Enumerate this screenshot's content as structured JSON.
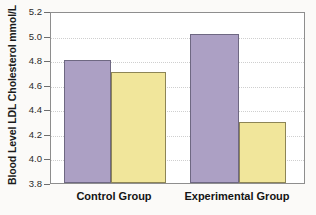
{
  "chart_data": {
    "type": "bar",
    "title": "",
    "xlabel": "",
    "ylabel": "Blood Level LDL Cholesterol mmol/L",
    "ylim": [
      3.8,
      5.2
    ],
    "ytick_labels": [
      "3.8",
      "4.0",
      "4.2",
      "4.4",
      "4.6",
      "4.8",
      "5.0",
      "5.2"
    ],
    "ytick_values": [
      3.8,
      4.0,
      4.2,
      4.4,
      4.6,
      4.8,
      5.0,
      5.2
    ],
    "grid": true,
    "legend": "none",
    "categories": [
      "Control Group",
      "Experimental Group"
    ],
    "series": [
      {
        "name": "series-a",
        "color": "#aca0c4",
        "values": [
          4.8,
          5.01
        ]
      },
      {
        "name": "series-b",
        "color": "#f1e69b",
        "values": [
          4.7,
          4.3
        ]
      }
    ],
    "bars": [
      {
        "category": "Control Group",
        "series": "series-a",
        "value": 4.8
      },
      {
        "category": "Control Group",
        "series": "series-b",
        "value": 4.7
      },
      {
        "category": "Experimental Group",
        "series": "series-a",
        "value": 5.01
      },
      {
        "category": "Experimental Group",
        "series": "series-b",
        "value": 4.3
      }
    ]
  },
  "colors": {
    "series_a": "#aca0c4",
    "series_b": "#f1e69b",
    "frame": "#8e8e8e",
    "gridline": "#cfcfcf",
    "text": "#141414",
    "background": "#fbfaf8"
  }
}
